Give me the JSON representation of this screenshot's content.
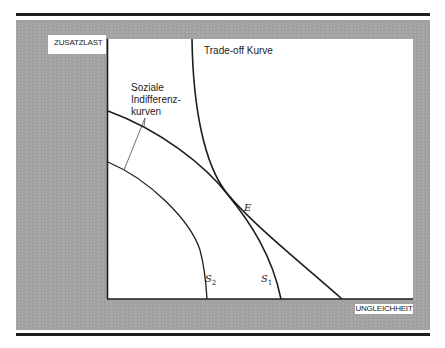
{
  "diagram": {
    "axes": {
      "y_label": "ZUSATZLAST",
      "x_label": "UNGLEICHHEIT"
    },
    "curves": {
      "tradeoff_label": "Trade-off Kurve",
      "indifference_label_lines": [
        "Soziale",
        "Indifferenz-",
        "kurven"
      ],
      "s1": {
        "symbol": "S",
        "sub": "1"
      },
      "s2": {
        "symbol": "S",
        "sub": "2"
      },
      "point_label": "E"
    },
    "colors": {
      "frame": "#a3a3a3",
      "plot_bg": "#ffffff",
      "line": "#1e1e1e"
    }
  }
}
